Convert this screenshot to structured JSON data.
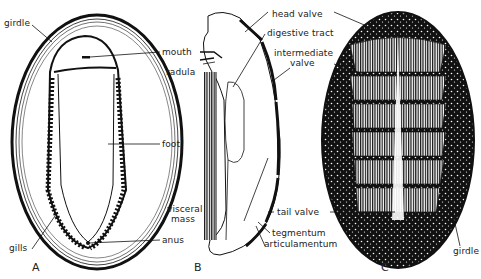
{
  "figure": {
    "panels": [
      {
        "id": "A",
        "label": "A"
      },
      {
        "id": "B",
        "label": "B"
      },
      {
        "id": "C",
        "label": "C"
      }
    ]
  },
  "labels": {
    "A": {
      "girdle": "girdle",
      "mouth": "mouth",
      "foot": "foot",
      "gills": "gills",
      "anus": "anus"
    },
    "B": {
      "radula": "radula",
      "head_valve": "head valve",
      "digestive_tract": "digestive tract",
      "intermediate_valve_1": "intermediate",
      "intermediate_valve_2": "valve",
      "visceral_mass_1": "visceral",
      "visceral_mass_2": "mass",
      "tail_valve": "tail valve",
      "tegmentum": "tegmentum",
      "articulamentum": "articulamentum"
    },
    "C": {
      "girdle": "girdle"
    }
  },
  "colors": {
    "ink": "#111111",
    "paper": "#ffffff"
  }
}
